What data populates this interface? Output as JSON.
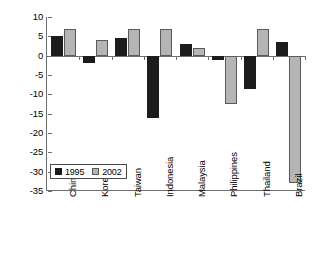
{
  "chart_data": {
    "type": "bar",
    "title": "",
    "subtitle": "",
    "xlabel": "",
    "ylabel": "",
    "ylim": [
      -35,
      10
    ],
    "ytick_labels": [
      "10",
      "5",
      "0",
      "-5",
      "-10",
      "-15",
      "-20",
      "-25",
      "-30",
      "-35"
    ],
    "ytick_values": [
      10,
      5,
      0,
      -5,
      -10,
      -15,
      -20,
      -25,
      -30,
      -35
    ],
    "grid": false,
    "legend_position": "bottom-left-inside",
    "categories": [
      "China",
      "Korea",
      "Taiwan",
      "Indonesia",
      "Malaysia",
      "Philippines",
      "Thailand",
      "Brazil"
    ],
    "series": [
      {
        "name": "1995",
        "color": "#1c1c1c",
        "values": [
          5,
          -2,
          4.5,
          -16,
          3,
          -1,
          -8.5,
          3.5
        ]
      },
      {
        "name": "2002",
        "color": "#b5b5b5",
        "values": [
          7,
          4,
          7,
          7,
          2,
          -12.5,
          7,
          -33
        ]
      }
    ]
  },
  "legend": {
    "items": [
      {
        "label": "1995",
        "swatch": "legend-swatch-1995"
      },
      {
        "label": "2002",
        "swatch": "legend-swatch-2002"
      }
    ]
  }
}
